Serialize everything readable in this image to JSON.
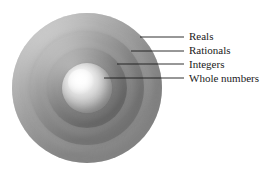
{
  "diagram": {
    "background_color": "#ffffff",
    "label_color": "#1a1a1a",
    "leader_line_color": "#1a1a1a",
    "shells": [
      {
        "id": "reals",
        "label": "Reals",
        "order": 1,
        "level": "outermost",
        "center": [
          88,
          88
        ],
        "radius": 75,
        "fill_color": "#9a9a9a",
        "highlight_color": "#d2d2d2"
      },
      {
        "id": "rationals",
        "label": "Rationals",
        "order": 2,
        "level": "second",
        "center": [
          87,
          88
        ],
        "radius": 57,
        "fill_color": "#8b8b8b",
        "highlight_color": "#c8c8c8"
      },
      {
        "id": "integers",
        "label": "Integers",
        "order": 3,
        "level": "third",
        "center": [
          87,
          88
        ],
        "radius": 40,
        "fill_color": "#7d7d7d",
        "highlight_color": "#bdbdbd"
      },
      {
        "id": "whole-numbers",
        "label": "Whole numbers",
        "order": 4,
        "level": "innermost",
        "center": [
          87,
          88
        ],
        "radius": 25,
        "fill_color": "#bdbdbd",
        "highlight_color": "#ffffff"
      }
    ],
    "callouts": [
      {
        "id": "reals",
        "label": "Reals",
        "anchor": [
          140,
          37
        ],
        "elbow": [
          184,
          37
        ],
        "text_position": [
          189,
          36
        ]
      },
      {
        "id": "rationals",
        "label": "Rationals",
        "anchor": [
          131,
          51
        ],
        "elbow": [
          184,
          51
        ],
        "text_position": [
          189,
          50
        ]
      },
      {
        "id": "integers",
        "label": "Integers",
        "anchor": [
          117,
          64
        ],
        "elbow": [
          184,
          64
        ],
        "text_position": [
          189,
          64
        ]
      },
      {
        "id": "whole-numbers",
        "label": "Whole numbers",
        "anchor": [
          104,
          78
        ],
        "elbow": [
          184,
          78
        ],
        "text_position": [
          189,
          78
        ]
      }
    ]
  }
}
